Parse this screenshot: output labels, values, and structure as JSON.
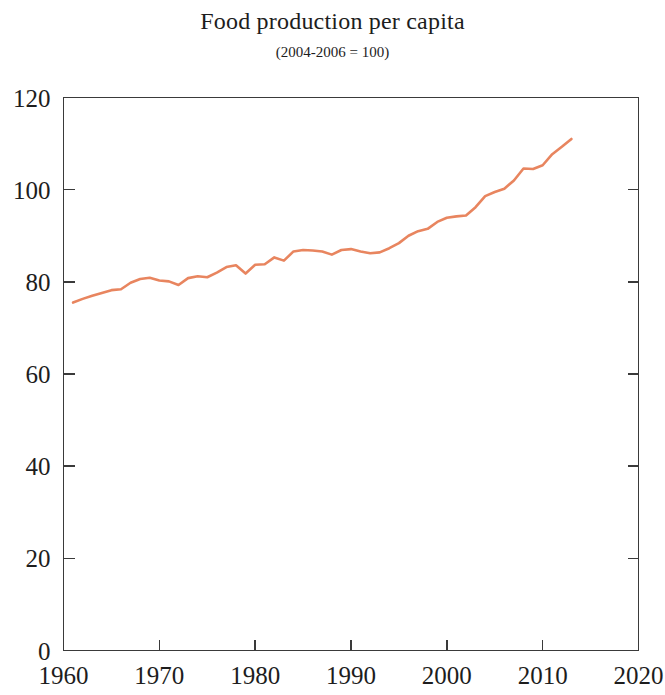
{
  "chart_data": {
    "type": "line",
    "title": "Food production per capita",
    "subtitle": "(2004-2006 = 100)",
    "xlabel": "",
    "ylabel": "",
    "xlim": [
      1960,
      2020
    ],
    "ylim": [
      0,
      120
    ],
    "grid": false,
    "legend": null,
    "line_color": "#e8855f",
    "axis_color": "#3a3a3a",
    "x_ticks": [
      1960,
      1970,
      1980,
      1990,
      2000,
      2010,
      2020
    ],
    "x_tick_labels": [
      "1960",
      "1970",
      "1980",
      "1990",
      "2000",
      "2010",
      "2020"
    ],
    "y_ticks": [
      0,
      20,
      40,
      60,
      80,
      100,
      120
    ],
    "y_tick_labels": [
      "0",
      "20",
      "40",
      "60",
      "80",
      "100",
      "120"
    ],
    "series": [
      {
        "name": "Food production per capita",
        "color": "#e8855f",
        "x": [
          1961,
          1962,
          1963,
          1964,
          1965,
          1966,
          1967,
          1968,
          1969,
          1970,
          1971,
          1972,
          1973,
          1974,
          1975,
          1976,
          1977,
          1978,
          1979,
          1980,
          1981,
          1982,
          1983,
          1984,
          1985,
          1986,
          1987,
          1988,
          1989,
          1990,
          1991,
          1992,
          1993,
          1994,
          1995,
          1996,
          1997,
          1998,
          1999,
          2000,
          2001,
          2002,
          2003,
          2004,
          2005,
          2006,
          2007,
          2008,
          2009,
          2010,
          2011,
          2012,
          2013
        ],
        "values": [
          75.5,
          76.3,
          77.0,
          77.6,
          78.2,
          78.4,
          79.8,
          80.6,
          80.9,
          80.3,
          80.1,
          79.3,
          80.8,
          81.2,
          81.0,
          82.0,
          83.2,
          83.6,
          81.8,
          83.7,
          83.8,
          85.3,
          84.6,
          86.6,
          86.9,
          86.8,
          86.6,
          85.9,
          86.9,
          87.1,
          86.6,
          86.2,
          86.4,
          87.3,
          88.4,
          90.0,
          91.0,
          91.5,
          93.0,
          93.9,
          94.2,
          94.4,
          96.2,
          98.6,
          99.5,
          100.2,
          102.0,
          104.6,
          104.5,
          105.3,
          107.7,
          109.3,
          111.0
        ]
      }
    ]
  },
  "axes": {
    "y_tick_labels": [
      "120",
      "100",
      "80",
      "60",
      "40",
      "20",
      "0"
    ],
    "x_tick_labels": [
      "1960",
      "1970",
      "1980",
      "1990",
      "2000",
      "2010",
      "2020"
    ]
  }
}
